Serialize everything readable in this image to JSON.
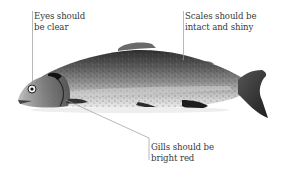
{
  "figure": {
    "callouts": [
      {
        "id": "eyes",
        "lines": [
          "Eyes should",
          "be clear"
        ]
      },
      {
        "id": "scales",
        "lines": [
          "Scales should be",
          "intact and shiny"
        ]
      },
      {
        "id": "gills",
        "lines": [
          "Gills should be",
          "bright red"
        ]
      }
    ]
  },
  "colors": {
    "background": "#ffffff",
    "text": "#3a3a3a",
    "leader_line": "#9a9a9a"
  }
}
